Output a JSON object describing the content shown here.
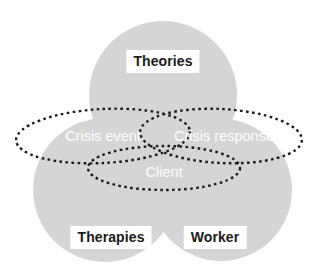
{
  "diagram": {
    "type": "venn",
    "background_color": "#ffffff",
    "circle_fill_color": "#d5d5d5",
    "dotted_stroke_color": "#1c1c1c",
    "circle_label_text_color": "#1a1a1a",
    "circle_label_box_color": "#ffffff",
    "ellipse_label_text_color": "#ffffff",
    "circles": [
      {
        "id": "theories",
        "label": "Theories",
        "cx": 163,
        "cy": 95,
        "r": 74,
        "label_x": 163,
        "label_y": 50
      },
      {
        "id": "therapies",
        "label": "Therapies",
        "cx": 105,
        "cy": 190,
        "r": 72,
        "label_x": 111,
        "label_y": 226
      },
      {
        "id": "worker",
        "label": "Worker",
        "cx": 221,
        "cy": 190,
        "r": 71,
        "label_x": 215,
        "label_y": 226
      }
    ],
    "ellipses": [
      {
        "id": "crisis-event",
        "label": "Crisis event",
        "cx": 103,
        "cy": 136,
        "rx": 87,
        "ry": 27,
        "rotate": -3,
        "label_x": 103,
        "label_y": 136
      },
      {
        "id": "crisis-response",
        "label": "Crisis response",
        "cx": 221,
        "cy": 136,
        "rx": 81,
        "ry": 27,
        "rotate": 3,
        "label_x": 224,
        "label_y": 136
      },
      {
        "id": "client",
        "label": "Client",
        "cx": 164,
        "cy": 168,
        "rx": 76,
        "ry": 22,
        "rotate": 0,
        "label_x": 164,
        "label_y": 172
      }
    ]
  }
}
